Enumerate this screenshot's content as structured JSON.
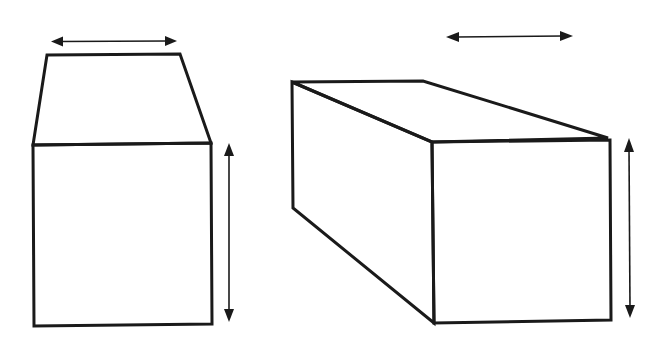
{
  "figure": {
    "background": "#ffffff",
    "stroke_color": "#1a1a1a",
    "figures": [
      {
        "id": "left-figure",
        "description": "Front elevation of a rectangular block with a trapezoidal top face, with width and height dimension arrows",
        "labels": []
      },
      {
        "id": "right-figure",
        "description": "Oblique 3D view of a rectangular prism (box), with width and height dimension arrows",
        "labels": []
      }
    ],
    "text": []
  }
}
